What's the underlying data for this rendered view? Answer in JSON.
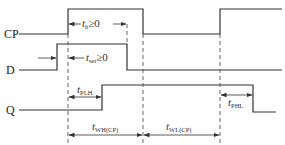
{
  "diagram": {
    "type": "timing-diagram",
    "signals": [
      {
        "name": "CP",
        "label": "CP"
      },
      {
        "name": "D",
        "label": "D"
      },
      {
        "name": "Q",
        "label": "Q"
      }
    ],
    "annotations": {
      "hold": {
        "t": "t",
        "sub": "h",
        "cond": "≥0"
      },
      "setup": {
        "t": "t",
        "sub": "set",
        "cond": "≥0"
      },
      "tplh": {
        "t": "t",
        "sub": "PLH"
      },
      "tphl": {
        "t": "t",
        "sub": "PHL"
      },
      "twh": {
        "t": "t",
        "sub": "WH(CP)"
      },
      "twl": {
        "t": "t",
        "sub": "WL(CP)"
      }
    }
  }
}
